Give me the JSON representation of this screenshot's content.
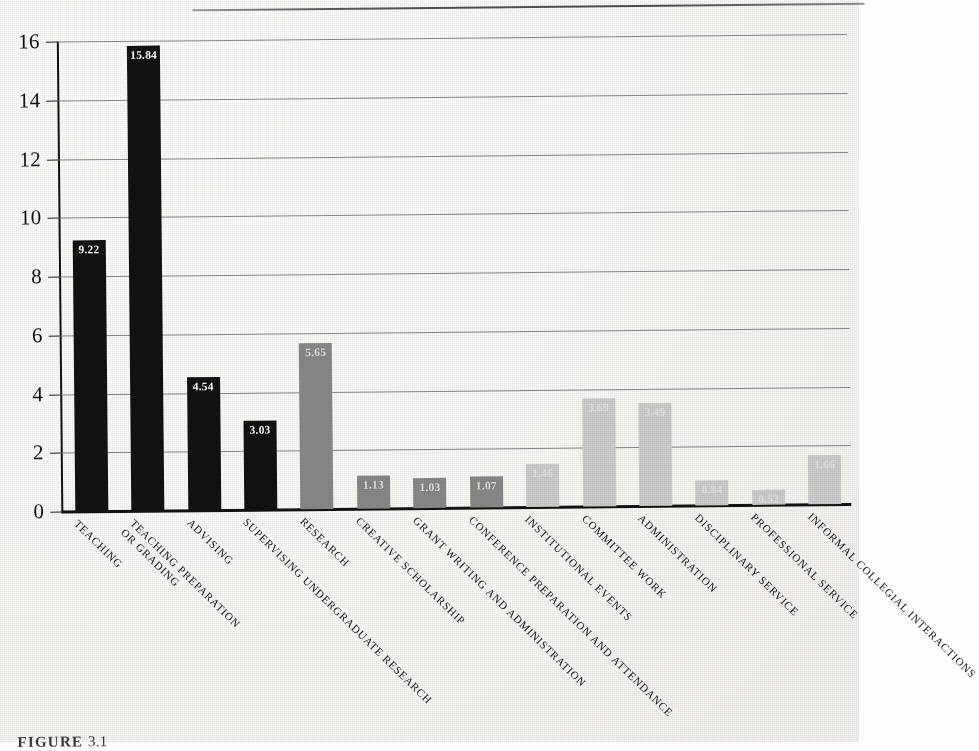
{
  "figure": {
    "caption_label": "FIGURE",
    "caption_rest": "3.1"
  },
  "chart_data": {
    "type": "bar",
    "title": "",
    "xlabel": "",
    "ylabel": "",
    "ylim": [
      0,
      16
    ],
    "yticks": [
      0,
      2,
      4,
      6,
      8,
      10,
      12,
      14,
      16
    ],
    "ytick_labels": [
      "0",
      "2",
      "4",
      "6",
      "8",
      "10",
      "12",
      "14",
      "16"
    ],
    "grid": true,
    "legend": "none",
    "categories": [
      "TEACHING",
      "TEACHING PREPARATION OR GRADING",
      "ADVISING",
      "SUPERVISING UNDERGRADUATE RESEARCH",
      "RESEARCH",
      "CREATIVE SCHOLARSHIP",
      "GRANT WRITING AND ADMINISTRATION",
      "CONFERENCE PREPARATION AND ATTENDANCE",
      "INSTITUTIONAL EVENTS",
      "COMMITTEE WORK",
      "ADMINISTRATION",
      "DISCIPLINARY SERVICE",
      "PROFESSIONAL SERVICE",
      "INFORMAL COLLEGIAL INTERACTIONS"
    ],
    "category_lines": [
      [
        "TEACHING"
      ],
      [
        "TEACHING PREPARATION",
        "OR GRADING"
      ],
      [
        "ADVISING"
      ],
      [
        "SUPERVISING UNDERGRADUATE RESEARCH"
      ],
      [
        "RESEARCH"
      ],
      [
        "CREATIVE SCHOLARSHIP"
      ],
      [
        "GRANT WRITING AND ADMINISTRATION"
      ],
      [
        "CONFERENCE PREPARATION AND ATTENDANCE"
      ],
      [
        "INSTITUTIONAL EVENTS"
      ],
      [
        "COMMITTEE WORK"
      ],
      [
        "ADMINISTRATION"
      ],
      [
        "DISCIPLINARY SERVICE"
      ],
      [
        "PROFESSIONAL SERVICE"
      ],
      [
        "INFORMAL COLLEGIAL INTERACTIONS"
      ]
    ],
    "values": [
      9.22,
      15.84,
      4.54,
      3.03,
      5.65,
      1.13,
      1.03,
      1.07,
      1.46,
      3.69,
      3.49,
      0.84,
      0.52,
      1.66
    ],
    "value_labels": [
      "9.22",
      "15.84",
      "4.54",
      "3.03",
      "5.65",
      "1.13",
      "1.03",
      "1.07",
      "1.46",
      "3.69",
      "3.49",
      "0.84",
      "0.52",
      "1.66"
    ],
    "groups": [
      "teaching",
      "teaching",
      "teaching",
      "teaching",
      "research",
      "research",
      "research",
      "research",
      "service",
      "service",
      "service",
      "service",
      "service",
      "service"
    ],
    "group_colors": {
      "teaching": "#121212",
      "research": "#8a8a8a",
      "service": "#cfcfcf"
    }
  }
}
